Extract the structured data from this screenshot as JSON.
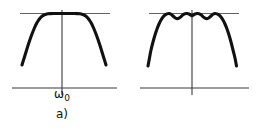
{
  "figure": {
    "background_color": "#ffffff",
    "curve_color": "#111111",
    "axis_color": "#3a3a3a",
    "reference_line_color": "#55514e",
    "panels": [
      {
        "id": "a",
        "caption": "a)",
        "x_axis_label": "ω",
        "x_axis_label_subscript": "0",
        "description": "maximally-flat (Butterworth-like) bandpass magnitude response, flat passband top",
        "chart_data": {
          "type": "line",
          "title": "",
          "xlabel": "ω",
          "ylabel": "",
          "grid": false,
          "legend": false,
          "xlim": [
            0,
            131
          ],
          "ylim": [
            0,
            132
          ],
          "axis": {
            "x_axis": {
              "x_start": 12,
              "x_end": 117,
              "y": 88
            },
            "y_axis": {
              "x": 62,
              "y_top": 10,
              "y_bottom": 95
            }
          },
          "reference_line": {
            "x_start": 20,
            "x_end": 110,
            "y": 13.5
          },
          "series": [
            {
              "name": "flat-top response",
              "points": [
                [
                  22,
                  65.0
                ],
                [
                  24,
                  58.5
                ],
                [
                  26,
                  52.0
                ],
                [
                  28,
                  45.5
                ],
                [
                  30,
                  39.5
                ],
                [
                  32,
                  34.0
                ],
                [
                  34,
                  29.0
                ],
                [
                  36,
                  24.5
                ],
                [
                  38,
                  21.0
                ],
                [
                  40,
                  18.2
                ],
                [
                  42,
                  16.2
                ],
                [
                  44,
                  15.0
                ],
                [
                  46,
                  14.2
                ],
                [
                  48,
                  13.8
                ],
                [
                  50,
                  13.6
                ],
                [
                  54,
                  13.5
                ],
                [
                  58,
                  13.5
                ],
                [
                  62,
                  13.5
                ],
                [
                  66,
                  13.5
                ],
                [
                  70,
                  13.5
                ],
                [
                  74,
                  13.5
                ],
                [
                  78,
                  13.6
                ],
                [
                  80,
                  13.8
                ],
                [
                  82,
                  14.2
                ],
                [
                  84,
                  15.0
                ],
                [
                  86,
                  16.2
                ],
                [
                  88,
                  18.2
                ],
                [
                  90,
                  21.0
                ],
                [
                  92,
                  24.5
                ],
                [
                  94,
                  29.0
                ],
                [
                  96,
                  34.0
                ],
                [
                  98,
                  39.5
                ],
                [
                  100,
                  45.5
                ],
                [
                  102,
                  52.0
                ],
                [
                  104,
                  58.5
                ],
                [
                  106,
                  65.0
                ]
              ]
            }
          ]
        }
      },
      {
        "id": "b",
        "caption": "b)",
        "x_axis_label": "ω",
        "x_axis_label_subscript": "0",
        "description": "equiripple (Chebyshev-like) bandpass magnitude response, two ripples in passband, steeper skirts",
        "chart_data": {
          "type": "line",
          "title": "",
          "xlabel": "ω",
          "ylabel": "",
          "grid": false,
          "legend": false,
          "xlim": [
            0,
            132
          ],
          "ylim": [
            0,
            132
          ],
          "axis": {
            "x_axis": {
              "x_start": 9,
              "x_end": 118,
              "y": 88
            },
            "y_axis": {
              "x": 61,
              "y_top": 10,
              "y_bottom": 95
            }
          },
          "reference_line": {
            "x_start": 18,
            "x_end": 108,
            "y": 13.5
          },
          "ripple_count": 2,
          "ripple_depth_px": 5,
          "series": [
            {
              "name": "equiripple response",
              "points": [
                [
                  17,
                  66.0
                ],
                [
                  18.5,
                  58.0
                ],
                [
                  20,
                  50.0
                ],
                [
                  22,
                  42.0
                ],
                [
                  24,
                  35.0
                ],
                [
                  26,
                  29.0
                ],
                [
                  28,
                  24.0
                ],
                [
                  30,
                  20.0
                ],
                [
                  32,
                  17.0
                ],
                [
                  34,
                  15.0
                ],
                [
                  36,
                  13.9
                ],
                [
                  38,
                  13.5
                ],
                [
                  40,
                  14.2
                ],
                [
                  42,
                  16.0
                ],
                [
                  44,
                  17.8
                ],
                [
                  46,
                  18.6
                ],
                [
                  48,
                  18.2
                ],
                [
                  50,
                  16.6
                ],
                [
                  52,
                  14.8
                ],
                [
                  54,
                  13.7
                ],
                [
                  56,
                  13.5
                ],
                [
                  58,
                  14.0
                ],
                [
                  60,
                  15.2
                ],
                [
                  61,
                  15.8
                ],
                [
                  62,
                  15.2
                ],
                [
                  64,
                  14.0
                ],
                [
                  66,
                  13.5
                ],
                [
                  68,
                  13.7
                ],
                [
                  70,
                  14.8
                ],
                [
                  72,
                  16.6
                ],
                [
                  74,
                  18.2
                ],
                [
                  76,
                  18.6
                ],
                [
                  78,
                  17.8
                ],
                [
                  80,
                  16.0
                ],
                [
                  82,
                  14.2
                ],
                [
                  84,
                  13.5
                ],
                [
                  86,
                  13.9
                ],
                [
                  88,
                  15.0
                ],
                [
                  90,
                  17.0
                ],
                [
                  92,
                  20.0
                ],
                [
                  94,
                  24.0
                ],
                [
                  96,
                  29.0
                ],
                [
                  98,
                  35.0
                ],
                [
                  100,
                  42.0
                ],
                [
                  102,
                  50.0
                ],
                [
                  104,
                  58.0
                ],
                [
                  105.5,
                  66.0
                ]
              ]
            }
          ]
        }
      }
    ]
  }
}
